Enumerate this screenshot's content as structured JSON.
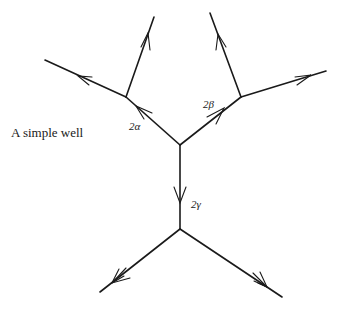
{
  "caption": "A simple well",
  "labels": {
    "alpha": "2α",
    "beta": "2β",
    "gamma": "2γ"
  },
  "colors": {
    "stroke": "#1a1a1a",
    "background": "#ffffff"
  },
  "graph": {
    "vertices": [
      {
        "id": "center",
        "x": 180,
        "y": 145
      },
      {
        "id": "left",
        "x": 126,
        "y": 97
      },
      {
        "id": "right",
        "x": 241,
        "y": 97
      },
      {
        "id": "lower",
        "x": 180,
        "y": 229
      }
    ],
    "edges": [
      {
        "from": "center",
        "to": "left",
        "label": "2α",
        "arrow": "toward-left"
      },
      {
        "from": "center",
        "to": "right",
        "label": "2β",
        "arrow": "toward-right"
      },
      {
        "from": "center",
        "to": "lower",
        "label": "2γ",
        "arrow": "downward"
      },
      {
        "from": "left",
        "to": "top-left-end",
        "arrow": "outward"
      },
      {
        "from": "left",
        "to": "far-left-end",
        "arrow": "outward"
      },
      {
        "from": "right",
        "to": "top-right-end",
        "arrow": "outward"
      },
      {
        "from": "right",
        "to": "far-right-end",
        "arrow": "outward"
      },
      {
        "from": "lower",
        "to": "bottom-left-end",
        "arrow": "outward"
      },
      {
        "from": "lower",
        "to": "bottom-right-end",
        "arrow": "outward"
      }
    ]
  }
}
